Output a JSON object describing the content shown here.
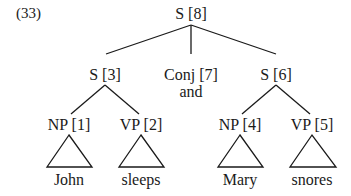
{
  "example_number": "(33)",
  "tree": {
    "root": {
      "label": "S [8]"
    },
    "s3": {
      "label": "S [3]"
    },
    "conj": {
      "label": "Conj [7]",
      "word": "and"
    },
    "s6": {
      "label": "S [6]"
    },
    "np1": {
      "label": "NP [1]",
      "word": "John"
    },
    "vp2": {
      "label": "VP [2]",
      "word": "sleeps"
    },
    "np4": {
      "label": "NP [4]",
      "word": "Mary"
    },
    "vp5": {
      "label": "VP [5]",
      "word": "snores"
    }
  },
  "colors": {
    "ink": "#1a1a1a",
    "background": "#ffffff"
  }
}
